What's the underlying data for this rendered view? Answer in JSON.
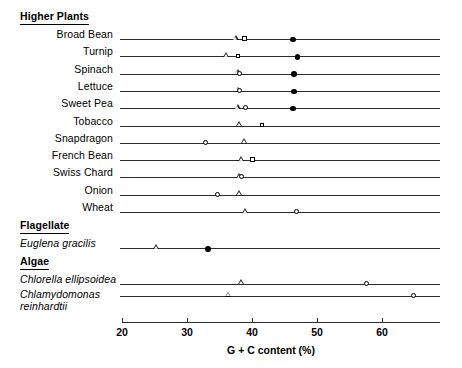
{
  "chart_data": {
    "type": "scatter",
    "title": "",
    "xlabel": "G + C content (%)",
    "ylabel": "",
    "xlim": [
      20,
      69
    ],
    "xticks": [
      20,
      30,
      40,
      50,
      60
    ],
    "xtick_labels": [
      "20",
      "30",
      "40",
      "50",
      "60"
    ],
    "grid": false,
    "legend_position": "none",
    "marker_types": [
      "open-triangle",
      "open-square",
      "open-circle",
      "filled-circle"
    ],
    "groups": [
      {
        "name": "Higher Plants",
        "rows": [
          {
            "label": "Broad Bean",
            "italic": false,
            "points": [
              {
                "marker": "open-triangle",
                "value": 37.5
              },
              {
                "marker": "open-square",
                "value": 39.0
              },
              {
                "marker": "filled-circle",
                "value": 46.3
              }
            ]
          },
          {
            "label": "Turnip",
            "italic": false,
            "points": [
              {
                "marker": "open-triangle",
                "value": 36.0
              },
              {
                "marker": "open-square",
                "value": 38.0
              },
              {
                "marker": "filled-circle",
                "value": 47.0
              }
            ]
          },
          {
            "label": "Spinach",
            "italic": false,
            "points": [
              {
                "marker": "open-triangle",
                "value": 37.8
              },
              {
                "marker": "open-circle",
                "value": 38.2
              },
              {
                "marker": "filled-circle",
                "value": 46.5
              }
            ]
          },
          {
            "label": "Lettuce",
            "italic": false,
            "points": [
              {
                "marker": "open-triangle",
                "value": 37.8
              },
              {
                "marker": "open-circle",
                "value": 38.2
              },
              {
                "marker": "filled-circle",
                "value": 46.5
              }
            ]
          },
          {
            "label": "Sweet Pea",
            "italic": false,
            "points": [
              {
                "marker": "open-triangle",
                "value": 37.8
              },
              {
                "marker": "open-circle",
                "value": 39.2
              },
              {
                "marker": "filled-circle",
                "value": 46.3
              }
            ]
          },
          {
            "label": "Tobacco",
            "italic": false,
            "points": [
              {
                "marker": "open-triangle",
                "value": 38.0
              },
              {
                "marker": "open-square",
                "value": 41.7
              }
            ]
          },
          {
            "label": "Snapdragon",
            "italic": false,
            "points": [
              {
                "marker": "open-circle",
                "value": 33.0
              },
              {
                "marker": "open-triangle",
                "value": 38.8
              }
            ]
          },
          {
            "label": "French Bean",
            "italic": false,
            "points": [
              {
                "marker": "open-triangle",
                "value": 38.3
              },
              {
                "marker": "open-square",
                "value": 40.2
              }
            ]
          },
          {
            "label": "Swiss Chard",
            "italic": false,
            "points": [
              {
                "marker": "open-triangle",
                "value": 38.0
              },
              {
                "marker": "open-circle",
                "value": 38.5
              }
            ]
          },
          {
            "label": "Onion",
            "italic": false,
            "points": [
              {
                "marker": "open-circle",
                "value": 34.8
              },
              {
                "marker": "open-triangle",
                "value": 38.0
              }
            ]
          },
          {
            "label": "Wheat",
            "italic": false,
            "points": [
              {
                "marker": "open-triangle",
                "value": 38.9
              },
              {
                "marker": "open-circle",
                "value": 47.0
              }
            ]
          }
        ]
      },
      {
        "name": "Flagellate",
        "rows": [
          {
            "label": "Euglena gracilis",
            "italic": true,
            "points": [
              {
                "marker": "open-triangle",
                "value": 25.2
              },
              {
                "marker": "filled-circle",
                "value": 33.2
              }
            ]
          }
        ]
      },
      {
        "name": "Algae",
        "rows": [
          {
            "label": "Chlorella ellipsoidea",
            "italic": true,
            "points": [
              {
                "marker": "open-triangle",
                "value": 38.4
              },
              {
                "marker": "open-circle",
                "value": 57.8
              }
            ]
          },
          {
            "label": "Chlamydomonas reinhardtii",
            "italic": true,
            "points": [
              {
                "marker": "open-triangle",
                "value": 36.3
              },
              {
                "marker": "open-circle",
                "value": 65.0
              }
            ]
          }
        ]
      }
    ]
  }
}
